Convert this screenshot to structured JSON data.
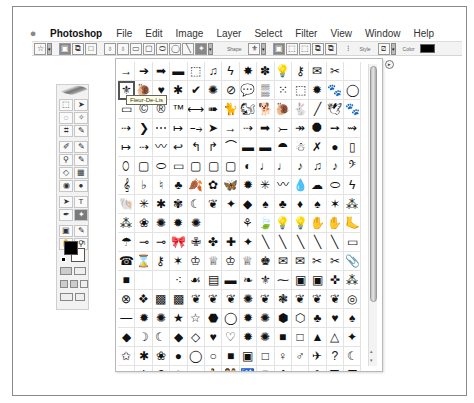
{
  "menubar": {
    "apple_icon": "",
    "app_name": "Photoshop",
    "items": [
      "File",
      "Edit",
      "Image",
      "Layer",
      "Select",
      "Filter",
      "View",
      "Window",
      "Help"
    ]
  },
  "options_bar": {
    "tool_preset_icon": "☆",
    "mode_buttons": [
      "▣",
      "⧉",
      "□"
    ],
    "path_tools": [
      "♁",
      "♁",
      "▭",
      "▢",
      "⬭",
      "◯",
      "╲",
      "✦"
    ],
    "shape_label": "Shape",
    "shape_value": "⚜",
    "combine_buttons": [
      "▣",
      "⬚",
      "⬚",
      "⧉",
      "⧉"
    ],
    "link_icon": "⁝",
    "style_label": "Style",
    "style_value": "⧄",
    "color_label": "Color",
    "color_value": "#000000",
    "dropdown_glyph": "▾"
  },
  "toolbox": {
    "tools": [
      "⬚",
      "➤",
      "◌",
      "✧",
      "⌗",
      "✎",
      "✐",
      "✎",
      "⚲",
      "✎",
      "◇",
      "▦",
      "◉",
      "●",
      "➤",
      "T",
      "✒",
      "✦",
      "▣",
      "✎",
      "✋",
      "⚲"
    ],
    "active_tool_index": 17,
    "foreground_color": "#000000",
    "background_color": "#ffffff"
  },
  "shape_picker": {
    "tooltip": "Fleur-De-Lis",
    "selected_index": 14,
    "panel_menu_icon": "▸",
    "scroll_up": "▴",
    "scroll_down": "▾",
    "shapes": [
      "→",
      "➔",
      "➡",
      "▬",
      "⬚",
      "♫",
      "ϟ",
      "✸",
      "✽",
      "💡",
      "⚷",
      "✉",
      "✂",
      "",
      "⚜",
      "🐌",
      "♥",
      "✱",
      "✔",
      "✺",
      "⊘",
      "💬",
      "▒",
      "⁙",
      "⬚",
      "✹",
      "🐾",
      "◯",
      "▭",
      "©",
      "®",
      "™",
      "⟷",
      "➠",
      "🐈",
      "🐿",
      "🐕",
      "🐌",
      "🐇",
      "╱",
      "🕊",
      "🐾",
      "⇢",
      "❯",
      "⋯",
      "↦",
      "⤍",
      "➤",
      "→",
      "⇢",
      "➡",
      "⤚",
      "↠",
      "⯃",
      "➙",
      "⇝",
      "↦",
      "⇢",
      "〰",
      "↩",
      "↰",
      "↱",
      "⌒",
      "▬",
      "▬",
      "⯊",
      "☃",
      "✗",
      "●",
      "▯",
      "⬯",
      "▢",
      "⬭",
      "▭",
      "▢",
      "▢",
      "▢",
      "◐",
      "♩",
      "♩",
      "♪",
      "♫",
      "♪",
      "𝄢",
      "𝄞",
      "♭",
      "♮",
      "♣",
      "🍂",
      "✿",
      "🦋",
      "✹",
      "✳",
      "〰",
      "💧",
      "☁",
      "⬭",
      "ϟ",
      "🐚",
      "✳",
      "✱",
      "✾",
      "☾",
      "❦",
      "✦",
      "◆",
      "♠",
      "♣",
      "♦",
      "♠",
      "✶",
      "⁂",
      "⁂",
      "❀",
      "✺",
      "✹",
      "✺",
      "",
      "",
      "⚘",
      "🍃",
      "💡",
      "💡",
      "✋",
      "✋",
      "🦶",
      "☂",
      "⊸",
      "⊸",
      "🎀",
      "✙",
      "✤",
      "✚",
      "✦",
      "╲",
      "╲",
      "╲",
      "╲",
      "╲",
      "▭",
      "☎",
      "⌛",
      "⚷",
      "✶",
      "♔",
      "♕",
      "♔",
      "♕",
      "♚",
      "✉",
      "✉",
      "✂",
      "✂",
      "📎",
      "■",
      "",
      "",
      "⁖",
      "☙",
      "▤",
      "▬",
      "❧",
      "⚜",
      "⁓",
      "▣",
      "▣",
      "✜",
      "⁂",
      "⊗",
      "❖",
      "▩",
      "▩",
      "❦",
      "❦",
      "❦",
      "✺",
      "❦",
      "❃",
      "❦",
      "❦",
      "❦",
      "◎",
      "―",
      "✹",
      "✺",
      "★",
      "☆",
      "⬣",
      "◯",
      "✹",
      "✺",
      "⬢",
      "⬡",
      "♣",
      "♥",
      "♠",
      "◆",
      "☽",
      "☾",
      "◆",
      "◇",
      "♥",
      "♡",
      "✹",
      "✺",
      "■",
      "□",
      "▲",
      "△",
      "✦",
      "✩",
      "✱",
      "❀",
      "●",
      "◯",
      "○",
      "■",
      "▣",
      "□",
      "♀",
      "♂",
      "✈",
      "?",
      "☾",
      "✔",
      "!",
      "?",
      "✸",
      "✖",
      "🚶",
      "👫",
      "♿",
      "⬣",
      "⬟",
      "▼",
      "⬢",
      "⛊",
      "⛉",
      "⌓",
      "🚗",
      "🚲",
      "",
      "⌒",
      "◔",
      "○",
      "↗",
      "⌓",
      "⚲",
      "✲",
      "⌓",
      "⁘",
      "✚"
    ]
  }
}
